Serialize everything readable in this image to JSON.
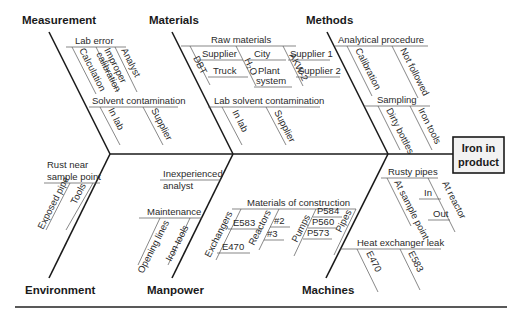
{
  "diagram": {
    "type": "fishbone",
    "effect": {
      "line1": "Iron in",
      "line2": "product"
    },
    "categories": {
      "measurement": "Measurement",
      "materials": "Materials",
      "methods": "Methods",
      "environment": "Environment",
      "manpower": "Manpower",
      "machines": "Machines"
    },
    "measurement": {
      "lab_error": "Lab error",
      "calculation": "Calculation",
      "improper": "Improper",
      "calibration": "calibration",
      "analyst": "Analyst",
      "solvent_contamination": "Solvent contamination",
      "in_lab": "In lab",
      "supplier": "Supplier"
    },
    "materials": {
      "raw_materials": "Raw materials",
      "dbt": "DBT",
      "supplier": "Supplier",
      "truck": "Truck",
      "h2o": "H₂O",
      "city": "City",
      "plant": "Plant",
      "system": "system",
      "akw2": "AKW-2",
      "supplier1": "Supplier 1",
      "supplier2": "Supplier 2",
      "lab_solvent_contamination": "Lab solvent contamination",
      "in_lab": "In lab",
      "supplier_b": "Supplier"
    },
    "methods": {
      "analytical_procedure": "Analytical procedure",
      "calibration": "Calibration",
      "not_followed": "Not followed",
      "sampling": "Sampling",
      "dirty_bottles": "Dirty bottles",
      "iron_tools": "Iron tools"
    },
    "environment": {
      "rust_near": "Rust near",
      "sample_point": "sample point",
      "exposed_pipe": "Exposed pipe",
      "tools": "Tools"
    },
    "manpower": {
      "inexperienced": "Inexperienced",
      "analyst": "analyst",
      "maintenance": "Maintenance",
      "opening_lines": "Opening lines",
      "iron_tools": "Iron tools"
    },
    "machines": {
      "materials_of_construction": "Materials of construction",
      "exchangers": "Exchangers",
      "e583": "E583",
      "e470": "E470",
      "reactors": "Reactors",
      "r2": "#2",
      "r3": "#3",
      "pumps": "Pumps",
      "p584": "P584",
      "p560": "P560",
      "p573": "P573",
      "pipes": "Pipes",
      "rusty_pipes": "Rusty pipes",
      "at_sample_point": "At sample point",
      "in": "In",
      "out": "Out",
      "at_reactor": "At reactor",
      "heat_exchanger_leak": "Heat exchanger leak",
      "hx_e470": "E470",
      "hx_e583": "E583"
    }
  }
}
